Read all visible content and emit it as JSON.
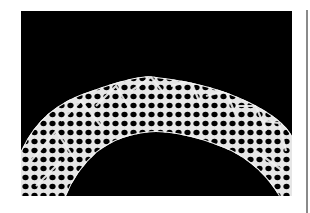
{
  "image": {
    "subject": "bobbin lace arc on black background",
    "alt": "White lace band forming an arch with diagonal chevron pattern on black background",
    "colors": {
      "background": "#000000",
      "lace": "#e8e8e8",
      "page": "#ffffff",
      "divider": "#8a8a8a"
    }
  }
}
